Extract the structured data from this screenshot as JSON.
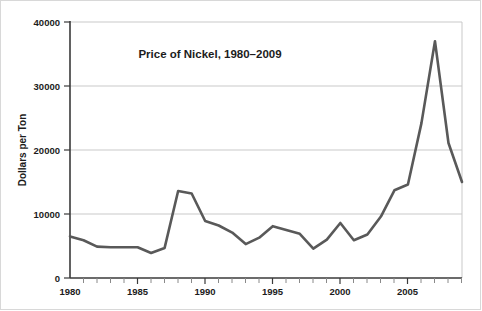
{
  "chart_data": {
    "type": "line",
    "title": "Price of Nickel, 1980–2009",
    "xlabel": "",
    "ylabel": "Dollars per Ton",
    "xlim": [
      1980,
      2009
    ],
    "ylim": [
      0,
      40000
    ],
    "grid": true,
    "legend": "none",
    "y_ticks": [
      0,
      10000,
      20000,
      30000,
      40000
    ],
    "y_tick_labels": [
      "0",
      "10000",
      "20000",
      "30000",
      "40000"
    ],
    "x_ticks": [
      1980,
      1985,
      1990,
      1995,
      2000,
      2005
    ],
    "x_tick_labels": [
      "1980",
      "1985",
      "1990",
      "1995",
      "2000",
      "2005"
    ],
    "x_minor_ticks": [
      1981,
      1982,
      1983,
      1984,
      1986,
      1987,
      1988,
      1989,
      1991,
      1992,
      1993,
      1994,
      1996,
      1997,
      1998,
      1999,
      2001,
      2002,
      2003,
      2004,
      2006,
      2007,
      2008,
      2009
    ],
    "series": [
      {
        "name": "Price of Nickel",
        "color": "#595959",
        "x": [
          1980,
          1981,
          1982,
          1983,
          1984,
          1985,
          1986,
          1987,
          1988,
          1989,
          1990,
          1991,
          1992,
          1993,
          1994,
          1995,
          1996,
          1997,
          1998,
          1999,
          2000,
          2001,
          2002,
          2003,
          2004,
          2005,
          2006,
          2007,
          2008,
          2009
        ],
        "values": [
          6500,
          5900,
          4900,
          4800,
          4800,
          4800,
          3900,
          4700,
          13600,
          13200,
          8900,
          8200,
          7100,
          5300,
          6300,
          8100,
          7500,
          6900,
          4600,
          6000,
          8600,
          5900,
          6800,
          9600,
          13700,
          14600,
          24200,
          37000,
          21100,
          15000
        ]
      }
    ]
  },
  "figure": {
    "width": 482,
    "height": 311,
    "background": "#ffffff",
    "border_color": "#d8d8d8",
    "grid_color": "#c9c9c9",
    "axis_color": "#3a3a3a",
    "line_color": "#595959"
  }
}
